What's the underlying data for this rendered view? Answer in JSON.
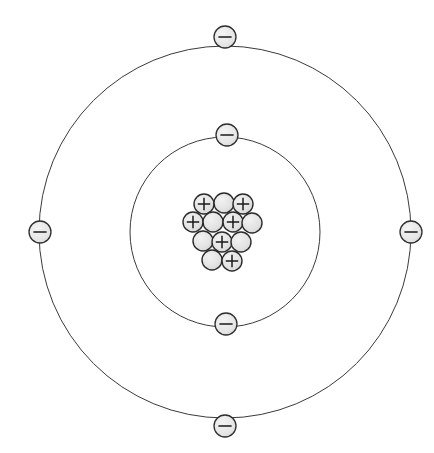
{
  "diagram": {
    "kind": "bohr-atom-model",
    "title": "",
    "canvas": {
      "width": 434,
      "height": 453,
      "background": "#ffffff"
    },
    "center": {
      "x": 225,
      "y": 232
    },
    "colors": {
      "orbit_stroke": "#3a3a3a",
      "particle_stroke": "#2b2b2b",
      "particle_fill": "#e2e2e2",
      "electron_fill": "#e6e6e6",
      "electron_stroke": "#2f2f2f",
      "sign_stroke": "#1a1a1a",
      "background": "#ffffff"
    },
    "shells": [
      {
        "name": "inner-shell",
        "label": "K shell",
        "radius": 95,
        "stroke_width": 1,
        "electron_count": 2,
        "electrons": [
          {
            "name": "electron",
            "sign": "−",
            "x": 227,
            "y": 135,
            "r": 11
          },
          {
            "name": "electron",
            "sign": "−",
            "x": 226,
            "y": 324,
            "r": 11
          }
        ]
      },
      {
        "name": "outer-shell",
        "label": "L shell",
        "radius": 186,
        "stroke_width": 1,
        "electron_count": 4,
        "electrons": [
          {
            "name": "electron",
            "sign": "−",
            "x": 225,
            "y": 37,
            "r": 11
          },
          {
            "name": "electron",
            "sign": "−",
            "x": 40,
            "y": 232,
            "r": 11
          },
          {
            "name": "electron",
            "sign": "−",
            "x": 411,
            "y": 232,
            "r": 11
          },
          {
            "name": "electron",
            "sign": "−",
            "x": 225,
            "y": 426,
            "r": 11
          }
        ]
      }
    ],
    "nucleus": {
      "name": "nucleus",
      "particle_radius": 10,
      "proton_sign": "+",
      "neutron_sign": "",
      "proton_count": 6,
      "neutron_count": 7,
      "particle_count": 13,
      "rows": [
        {
          "row": 1,
          "particles": [
            {
              "type": "proton",
              "sign": "+",
              "x": 204,
              "y": 204
            },
            {
              "type": "neutron",
              "sign": "",
              "x": 224,
              "y": 203
            },
            {
              "type": "proton",
              "sign": "+",
              "x": 243,
              "y": 204
            }
          ]
        },
        {
          "row": 2,
          "particles": [
            {
              "type": "proton",
              "sign": "+",
              "x": 193,
              "y": 222
            },
            {
              "type": "neutron",
              "sign": "",
              "x": 213,
              "y": 222
            },
            {
              "type": "proton",
              "sign": "+",
              "x": 233,
              "y": 222
            },
            {
              "type": "neutron",
              "sign": "",
              "x": 252,
              "y": 223
            }
          ]
        },
        {
          "row": 3,
          "particles": [
            {
              "type": "neutron",
              "sign": "",
              "x": 203,
              "y": 241
            },
            {
              "type": "proton",
              "sign": "+",
              "x": 222,
              "y": 242
            },
            {
              "type": "neutron",
              "sign": "",
              "x": 241,
              "y": 242
            }
          ]
        },
        {
          "row": 4,
          "particles": [
            {
              "type": "neutron",
              "sign": "",
              "x": 212,
              "y": 260
            },
            {
              "type": "proton",
              "sign": "+",
              "x": 232,
              "y": 261
            }
          ]
        }
      ]
    }
  }
}
